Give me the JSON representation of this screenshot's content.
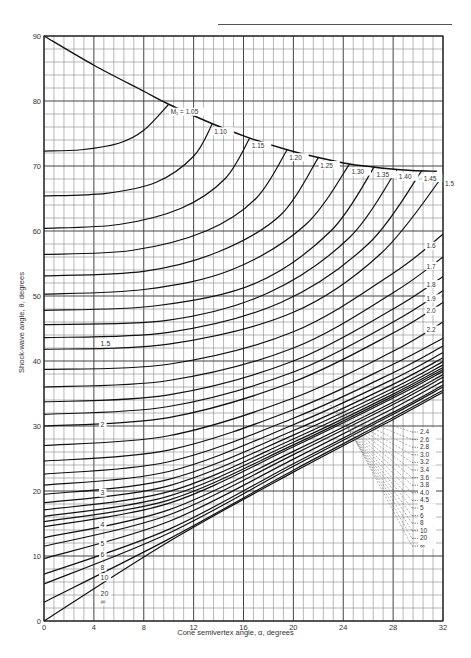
{
  "chart_data": {
    "type": "line",
    "title": "",
    "xlabel": "Cone semivertex angle, α, degrees",
    "ylabel": "Shock-wave angle, θ, degrees",
    "xlim": [
      0,
      32
    ],
    "ylim": [
      0,
      90
    ],
    "x_ticks": [
      0,
      4,
      8,
      12,
      16,
      20,
      24,
      28,
      32
    ],
    "y_ticks": [
      0,
      10,
      20,
      30,
      40,
      50,
      60,
      70,
      80,
      90
    ],
    "grid": true,
    "grid_minor_step_x": 0.8,
    "grid_minor_step_y": 2,
    "legend_position": "inline labels on curves",
    "detachment_envelope": {
      "name": "Shock detachment limit",
      "x": [
        0,
        4,
        8,
        10,
        13.5,
        16.5,
        19.5,
        22,
        24.5,
        27,
        29.5,
        31.5
      ],
      "y": [
        90,
        85.5,
        81.5,
        79.5,
        76.5,
        74.3,
        72.5,
        71.3,
        70.3,
        69.7,
        69.3,
        69.2
      ]
    },
    "series": [
      {
        "name": "M1 = 1.05",
        "label": "M₁ = 1.05",
        "x": [
          0,
          3,
          6,
          8,
          10
        ],
        "y": [
          72.3,
          72.5,
          73.5,
          75.5,
          79.5
        ]
      },
      {
        "name": "1.10",
        "label": "1.10",
        "x": [
          0,
          5,
          9,
          12,
          13.5
        ],
        "y": [
          65.4,
          65.8,
          67.5,
          71.5,
          76.5
        ]
      },
      {
        "name": "1.15",
        "label": "1.15",
        "x": [
          0,
          6,
          11,
          14.5,
          16.5
        ],
        "y": [
          60.4,
          61,
          63.5,
          68,
          74.3
        ]
      },
      {
        "name": "1.20",
        "label": "1.20",
        "x": [
          0,
          7,
          13,
          17,
          19.5
        ],
        "y": [
          56.4,
          57,
          60,
          65,
          72.5
        ]
      },
      {
        "name": "1.25",
        "label": "1.25",
        "x": [
          0,
          8,
          14,
          19,
          22
        ],
        "y": [
          53.1,
          53.8,
          56.8,
          62.5,
          71.3
        ]
      },
      {
        "name": "1.30",
        "label": "1.30",
        "x": [
          0,
          8,
          15,
          21,
          24.5
        ],
        "y": [
          50.3,
          51,
          54,
          61,
          70.3
        ]
      },
      {
        "name": "1.35",
        "label": "1.35",
        "x": [
          0,
          9,
          17,
          23,
          26.5
        ],
        "y": [
          47.8,
          48.5,
          52,
          60,
          69.9
        ]
      },
      {
        "name": "1.40",
        "label": "1.40",
        "x": [
          0,
          10,
          18,
          24.5,
          28.3
        ],
        "y": [
          45.6,
          46.3,
          50.5,
          59,
          69.5
        ]
      },
      {
        "name": "1.45",
        "label": "1.45",
        "x": [
          0,
          10,
          19,
          26,
          30.3
        ],
        "y": [
          43.6,
          44.4,
          49,
          58,
          69.3
        ]
      },
      {
        "name": "1.5",
        "label": "1.5",
        "x": [
          0,
          10,
          20,
          27,
          32
        ],
        "y": [
          41.8,
          42.6,
          47.5,
          56.5,
          68.5
        ]
      },
      {
        "name": "1.6",
        "label": "1.6",
        "x": [
          0,
          10,
          20,
          28,
          32
        ],
        "y": [
          38.7,
          39.5,
          44.5,
          53.5,
          59.5
        ]
      },
      {
        "name": "1.7",
        "label": "1.7",
        "x": [
          0,
          10,
          20,
          28,
          32
        ],
        "y": [
          36,
          37,
          42,
          50.5,
          56
        ]
      },
      {
        "name": "1.8",
        "label": "1.8",
        "x": [
          0,
          10,
          20,
          28,
          32
        ],
        "y": [
          33.7,
          34.8,
          40,
          48,
          53
        ]
      },
      {
        "name": "1.9",
        "label": "1.9",
        "x": [
          0,
          10,
          20,
          28,
          32
        ],
        "y": [
          31.8,
          33,
          38.3,
          46,
          50.8
        ]
      },
      {
        "name": "2.0",
        "label": "2.0",
        "x": [
          0,
          10,
          20,
          28,
          32
        ],
        "y": [
          30,
          31.3,
          36.8,
          44.3,
          49
        ]
      },
      {
        "name": "2.2",
        "label": "2.2",
        "x": [
          0,
          10,
          20,
          28,
          32
        ],
        "y": [
          27,
          28.5,
          34.3,
          41.5,
          46
        ]
      },
      {
        "name": "2.4",
        "label": "2.4",
        "x": [
          0,
          10,
          20,
          28,
          32
        ],
        "y": [
          24.6,
          26.3,
          32.5,
          39.5,
          43.5
        ]
      },
      {
        "name": "2.6",
        "label": "2.6",
        "x": [
          0,
          10,
          20,
          28,
          32
        ],
        "y": [
          22.6,
          24.5,
          31.2,
          38.2,
          42.3
        ]
      },
      {
        "name": "2.8",
        "label": "2.8",
        "x": [
          0,
          10,
          20,
          28,
          32
        ],
        "y": [
          20.9,
          23,
          30.2,
          37.2,
          41.3
        ]
      },
      {
        "name": "3.0",
        "label": "3.0",
        "x": [
          0,
          10,
          20,
          28,
          32
        ],
        "y": [
          19.5,
          21.8,
          29.3,
          36.4,
          40.5
        ]
      },
      {
        "name": "3.2",
        "label": "3.2",
        "x": [
          0,
          10,
          20,
          28,
          32
        ],
        "y": [
          18.2,
          20.8,
          28.6,
          35.8,
          39.9
        ]
      },
      {
        "name": "3.4",
        "label": "3.4",
        "x": [
          0,
          10,
          20,
          28,
          32
        ],
        "y": [
          17.1,
          19.9,
          28,
          35.3,
          39.4
        ]
      },
      {
        "name": "3.6",
        "label": "3.6",
        "x": [
          0,
          10,
          20,
          28,
          32
        ],
        "y": [
          16.1,
          19.2,
          27.5,
          34.9,
          39
        ]
      },
      {
        "name": "3.8",
        "label": "3.8",
        "x": [
          0,
          10,
          20,
          28,
          32
        ],
        "y": [
          15.3,
          18.6,
          27.1,
          34.6,
          38.7
        ]
      },
      {
        "name": "4.0",
        "label": "4.0",
        "x": [
          0,
          10,
          20,
          28,
          32
        ],
        "y": [
          14.5,
          18.1,
          26.8,
          34.3,
          38.4
        ]
      },
      {
        "name": "4.5",
        "label": "4.5",
        "x": [
          0,
          10,
          20,
          28,
          32
        ],
        "y": [
          12.8,
          17.1,
          26.1,
          33.7,
          37.9
        ]
      },
      {
        "name": "5",
        "label": "5",
        "x": [
          0,
          10,
          20,
          28,
          32
        ],
        "y": [
          11.5,
          16.3,
          25.6,
          33.3,
          37.5
        ]
      },
      {
        "name": "6",
        "label": "6",
        "x": [
          0,
          10,
          20,
          28,
          32
        ],
        "y": [
          9.6,
          15.3,
          24.9,
          32.7,
          36.9
        ]
      },
      {
        "name": "8",
        "label": "8",
        "x": [
          0,
          10,
          20,
          28,
          32
        ],
        "y": [
          7.2,
          14.1,
          24.2,
          32.1,
          36.3
        ]
      },
      {
        "name": "10",
        "label": "10",
        "x": [
          0,
          10,
          20,
          28,
          32
        ],
        "y": [
          5.7,
          13.5,
          23.8,
          31.8,
          36
        ]
      },
      {
        "name": "20",
        "label": "20",
        "x": [
          0,
          10,
          20,
          28,
          32
        ],
        "y": [
          2.9,
          12.6,
          23.2,
          31.3,
          35.5
        ]
      },
      {
        "name": "∞",
        "label": "∞",
        "x": [
          0,
          10,
          20,
          28,
          32
        ],
        "y": [
          0,
          12.2,
          22.9,
          31,
          35.2
        ]
      }
    ],
    "inline_left_labels": [
      {
        "text": "1.5",
        "x": 4.7,
        "y": 42.5
      },
      {
        "text": "2",
        "x": 4.7,
        "y": 30
      },
      {
        "text": "3",
        "x": 4.7,
        "y": 19.5
      },
      {
        "text": "4",
        "x": 4.7,
        "y": 14.6
      },
      {
        "text": "5",
        "x": 4.7,
        "y": 11.8
      },
      {
        "text": "6",
        "x": 4.7,
        "y": 10
      },
      {
        "text": "8",
        "x": 4.7,
        "y": 8
      },
      {
        "text": "10",
        "x": 4.7,
        "y": 6.5
      },
      {
        "text": "20",
        "x": 4.7,
        "y": 4
      },
      {
        "text": "∞",
        "x": 4.7,
        "y": 2.8
      }
    ],
    "inline_right_labels": [
      {
        "text": "1.6",
        "x": 31.0,
        "y": 57.5
      },
      {
        "text": "1.7",
        "x": 31.0,
        "y": 54.4
      },
      {
        "text": "1.8",
        "x": 31.0,
        "y": 51.6
      },
      {
        "text": "1.9",
        "x": 31.0,
        "y": 49.4
      },
      {
        "text": "2.0",
        "x": 31.0,
        "y": 47.5
      },
      {
        "text": "2.2",
        "x": 31.0,
        "y": 44.6
      }
    ],
    "legend_column": {
      "position": "lower-right inline list",
      "entries": [
        "2.4",
        "2.6",
        "2.8",
        "3.0",
        "3.2",
        "3.4",
        "3.6",
        "3.8",
        "4.0",
        "4.5",
        "5",
        "6",
        "8",
        "10",
        "20",
        "∞"
      ]
    },
    "envelope_labels": [
      "M₁ = 1.05",
      "1.10",
      "1.15",
      "1.20",
      "1.25",
      "1.30",
      "1.35",
      "1.40",
      "1.45",
      "1.5"
    ]
  },
  "axes": {
    "xlabel": "Cone semivertex angle, α, degrees",
    "ylabel": "Shock-wave angle, θ, degrees"
  }
}
